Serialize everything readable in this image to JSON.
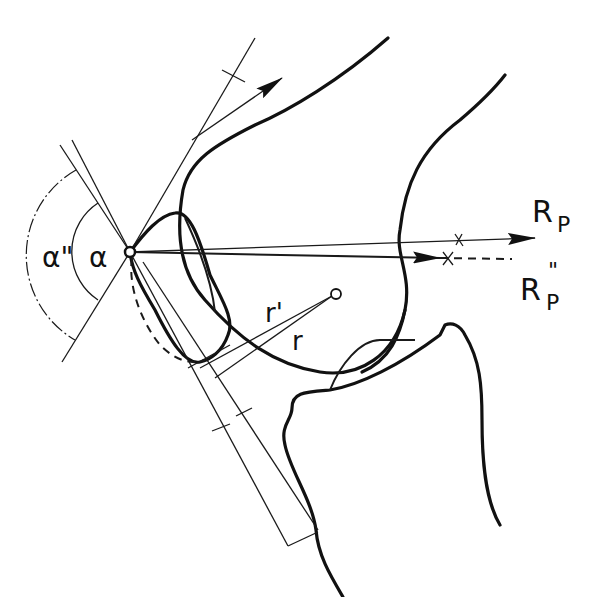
{
  "diagram": {
    "colors": {
      "line": "#111111",
      "background": "#ffffff"
    },
    "labels": {
      "alpha": "α",
      "alpha_double_prime": "α\"",
      "r": "r",
      "r_prime": "r'",
      "R_P": "R",
      "R_P_sub": "P",
      "R_P_double_prime": "R",
      "R_P_double_prime_sub": "P",
      "R_P_double_prime_sup": "\""
    },
    "elements": [
      "femur-outline",
      "tibia-outline",
      "patella-outline",
      "patella-outline-dashed",
      "quadriceps-tendon-vector",
      "patellar-ligament-lines",
      "resultant-force-R_P",
      "resultant-force-R_P-double-prime-dashed",
      "angle-arc-alpha",
      "angle-arc-alpha-double-prime",
      "radius-r",
      "radius-r-prime",
      "rotation-center"
    ]
  }
}
